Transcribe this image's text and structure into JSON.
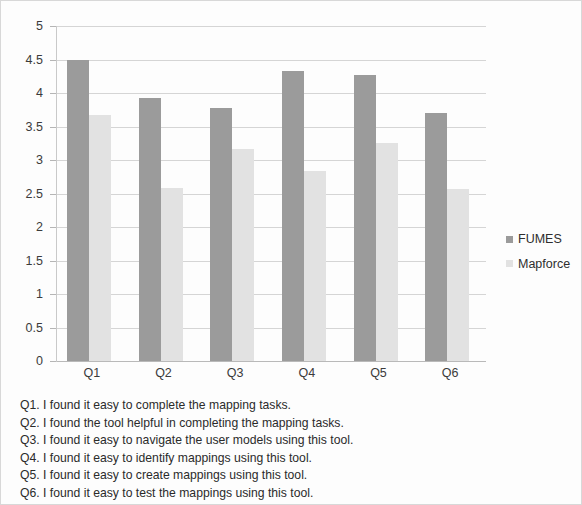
{
  "chart_data": {
    "type": "bar",
    "title": "",
    "xlabel": "",
    "ylabel": "",
    "categories": [
      "Q1",
      "Q2",
      "Q3",
      "Q4",
      "Q5",
      "Q6"
    ],
    "series": [
      {
        "name": "FUMES",
        "color": "#9b9b9b",
        "values": [
          4.5,
          3.92,
          3.78,
          4.33,
          4.27,
          3.7
        ]
      },
      {
        "name": "Mapforce",
        "color": "#e2e2e2",
        "values": [
          3.67,
          2.58,
          3.17,
          2.83,
          3.25,
          2.57
        ]
      }
    ],
    "ylim": [
      0,
      5
    ],
    "ytick_step": 0.5,
    "ytick_labels": [
      "5",
      "4.5",
      "4",
      "3.5",
      "3",
      "2.5",
      "2",
      "1.5",
      "1",
      "0.5",
      "0"
    ],
    "grid": true,
    "legend_position": "right"
  },
  "legend": {
    "entries": [
      {
        "label": "FUMES"
      },
      {
        "label": "Mapforce"
      }
    ]
  },
  "caption": {
    "lines": [
      "Q1. I found it easy to complete the mapping tasks.",
      "Q2. I found the tool helpful in completing the mapping tasks.",
      "Q3. I found it easy to navigate the user models using this tool.",
      "Q4. I found it easy to identify mappings using this tool.",
      "Q5. I found it easy to create mappings using this tool.",
      "Q6. I found it easy to test the mappings using this tool."
    ]
  }
}
